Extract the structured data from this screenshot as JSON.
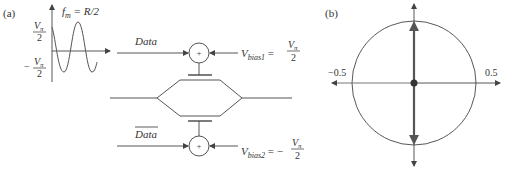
{
  "panel_a": {
    "label": "(a)",
    "waveform": {
      "freq_label": "f",
      "freq_sub": "m",
      "freq_rhs": " = R/2",
      "top_num": "V",
      "top_sub": "π",
      "top_den": "2",
      "bot_sign": "−",
      "bot_num": "V",
      "bot_sub": "π",
      "bot_den": "2"
    },
    "upper_arm": {
      "input_label": "Data",
      "summer_symbol": "+",
      "bias_label": "V",
      "bias_sub": "bias1",
      "bias_eq": " = ",
      "bias_num": "V",
      "bias_num_sub": "π",
      "bias_den": "2"
    },
    "lower_arm": {
      "input_label": "Data",
      "summer_symbol": "+",
      "bias_label": "V",
      "bias_sub": "bias2",
      "bias_eq": " = −",
      "bias_num": "V",
      "bias_num_sub": "π",
      "bias_den": "2"
    }
  },
  "panel_b": {
    "label": "(b)",
    "x_left_label": "−0.5",
    "x_right_label": "0.5"
  },
  "colors": {
    "line": "#555555",
    "text": "#333333",
    "phasor": "#555555"
  }
}
